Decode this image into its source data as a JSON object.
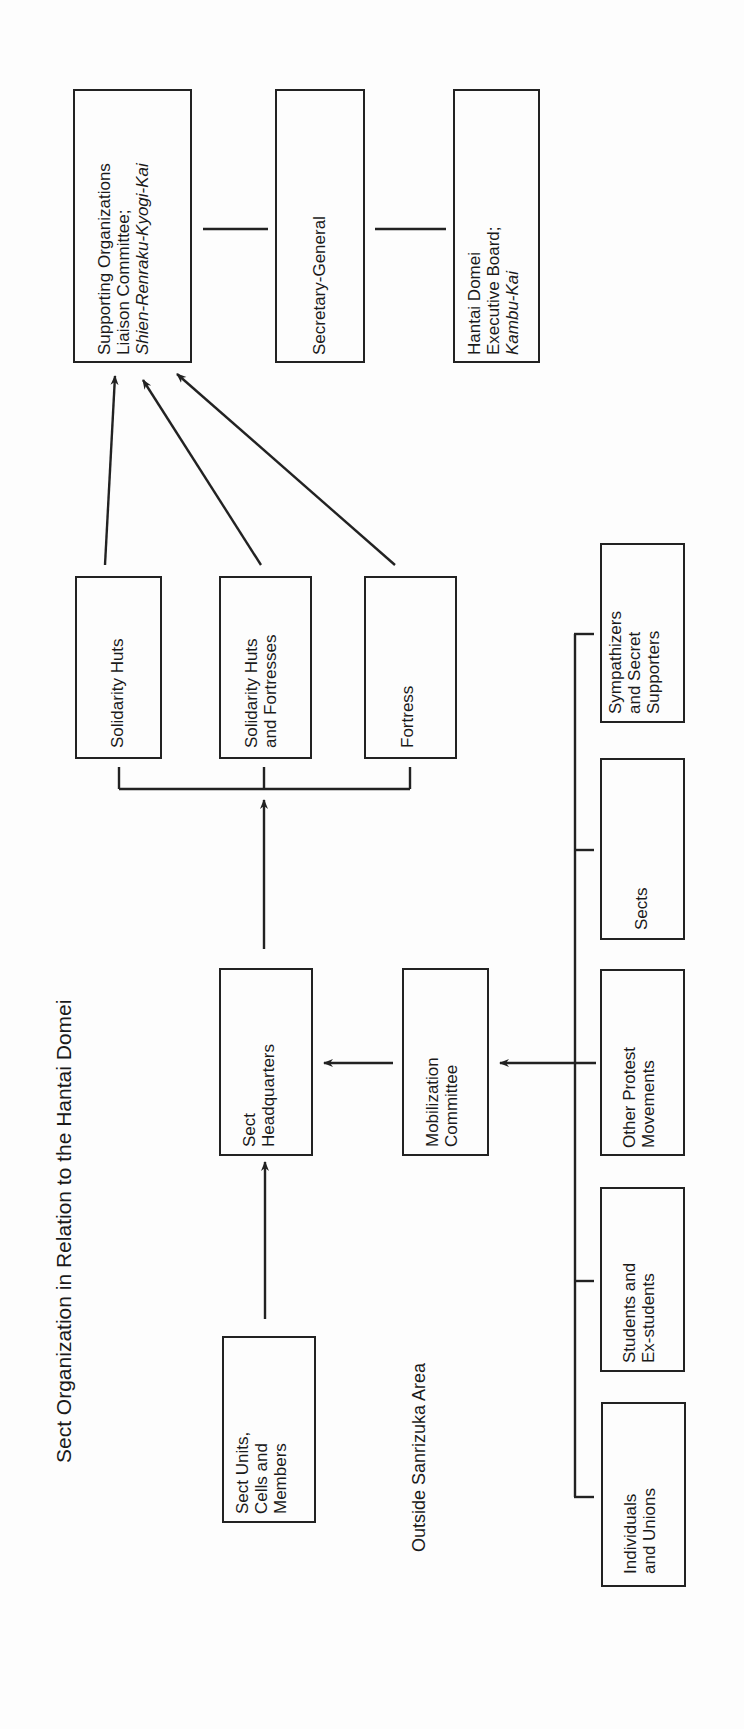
{
  "title": "Sect Organization in Relation to the Hantai Domei",
  "area_label": "Outside Sanrizuka Area",
  "top_row": {
    "supporting": {
      "lines": [
        "Supporting Organizations",
        "Liaison Committee;"
      ],
      "italic": "Shien-Renraku-Kyogi-Kai"
    },
    "secretary": {
      "label": "Secretary-General"
    },
    "hantai": {
      "lines": [
        "Hantai Domei",
        "Executive Board;"
      ],
      "italic": "Kambu-Kai"
    }
  },
  "middle_row": [
    {
      "lines": [
        "Solidarity Huts"
      ]
    },
    {
      "lines": [
        "Solidarity Huts",
        "and Fortresses"
      ]
    },
    {
      "lines": [
        "Fortress"
      ]
    }
  ],
  "sect_headquarters": {
    "lines": [
      "Sect",
      "Headquarters"
    ]
  },
  "mobilization": {
    "lines": [
      "Mobilization",
      "Committee"
    ]
  },
  "sect_units": {
    "lines": [
      "Sect Units,",
      "Cells and",
      "Members"
    ]
  },
  "outside_groups": [
    {
      "lines": [
        "Sympathizers",
        "and Secret",
        "Supporters"
      ]
    },
    {
      "lines": [
        "Sects"
      ]
    },
    {
      "lines": [
        "Other Protest",
        "Movements"
      ]
    },
    {
      "lines": [
        "Students and",
        "Ex-students"
      ]
    },
    {
      "lines": [
        "Individuals",
        "and Unions"
      ]
    }
  ],
  "colors": {
    "ink": "#222222",
    "background": "#fdfdfd"
  }
}
